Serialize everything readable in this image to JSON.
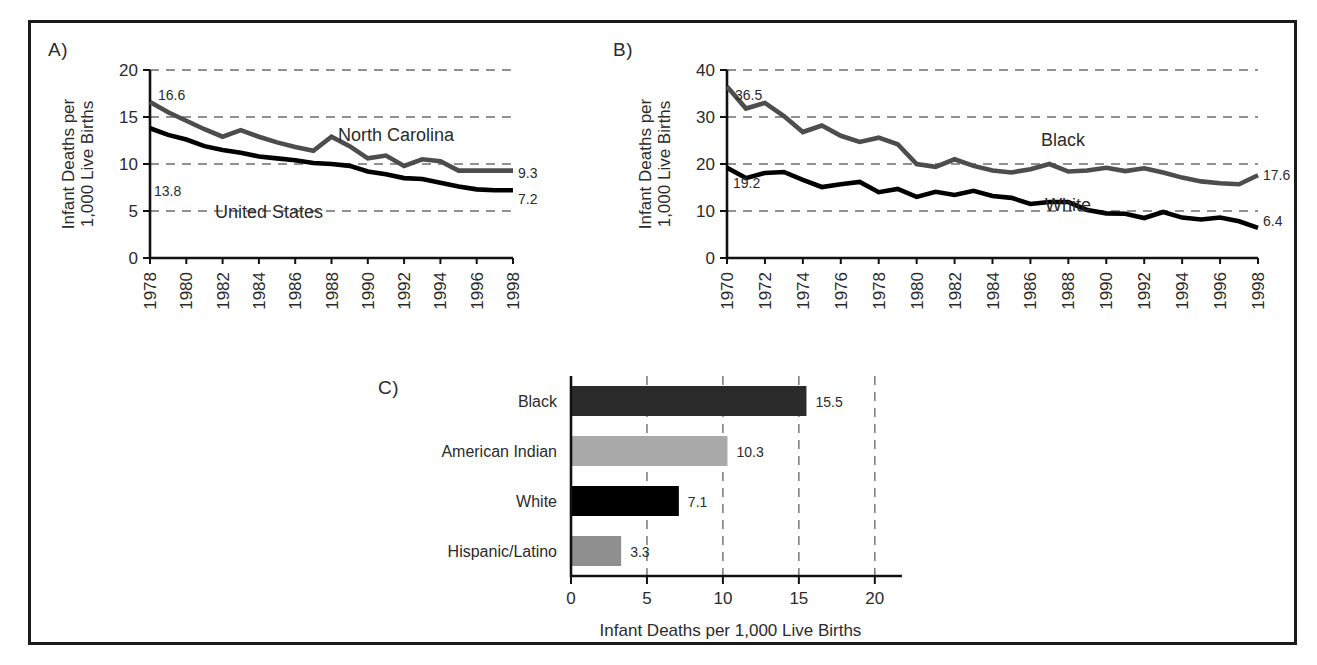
{
  "figure": {
    "panels": [
      "A)",
      "B)",
      "C)"
    ]
  },
  "chart_data": [
    {
      "panel": "A)",
      "type": "line",
      "title": "",
      "xlabel": "",
      "ylabel": "Infant Deaths per 1,000 Live Births",
      "ylim": [
        0,
        20
      ],
      "xlim": [
        1978,
        1998
      ],
      "yticks": [
        "0",
        "5",
        "10",
        "15",
        "20"
      ],
      "ytick_values": [
        0,
        5,
        10,
        15,
        20
      ],
      "xticks": [
        "1978",
        "1980",
        "1982",
        "1984",
        "1986",
        "1988",
        "1990",
        "1992",
        "1994",
        "1996",
        "1998"
      ],
      "xtick_values": [
        1978,
        1980,
        1982,
        1984,
        1986,
        1988,
        1990,
        1992,
        1994,
        1996,
        1998
      ],
      "grid": true,
      "x": [
        1978,
        1979,
        1980,
        1981,
        1982,
        1983,
        1984,
        1985,
        1986,
        1987,
        1988,
        1989,
        1990,
        1991,
        1992,
        1993,
        1994,
        1995,
        1996,
        1997,
        1998
      ],
      "series": [
        {
          "name": "North Carolina",
          "color": "#4d4d4d",
          "values": [
            16.6,
            15.5,
            14.6,
            13.7,
            12.9,
            13.6,
            12.9,
            12.3,
            11.8,
            11.4,
            12.9,
            11.9,
            10.6,
            10.9,
            9.8,
            10.5,
            10.3,
            9.3,
            9.3,
            9.3,
            9.3
          ],
          "start_label": "16.6",
          "end_label": "9.3"
        },
        {
          "name": "United States",
          "color": "#000000",
          "values": [
            13.8,
            13.1,
            12.6,
            11.9,
            11.5,
            11.2,
            10.8,
            10.6,
            10.4,
            10.1,
            10.0,
            9.8,
            9.2,
            8.9,
            8.5,
            8.4,
            8.0,
            7.6,
            7.3,
            7.2,
            7.2
          ],
          "start_label": "13.8",
          "end_label": "7.2"
        }
      ]
    },
    {
      "panel": "B)",
      "type": "line",
      "title": "",
      "xlabel": "",
      "ylabel": "Infant Deaths per 1,000 Live Births",
      "ylim": [
        0,
        40
      ],
      "xlim": [
        1970,
        1998
      ],
      "yticks": [
        "0",
        "10",
        "20",
        "30",
        "40"
      ],
      "ytick_values": [
        0,
        10,
        20,
        30,
        40
      ],
      "xticks": [
        "1970",
        "1972",
        "1974",
        "1976",
        "1978",
        "1980",
        "1982",
        "1984",
        "1986",
        "1988",
        "1990",
        "1992",
        "1994",
        "1996",
        "1998"
      ],
      "xtick_values": [
        1970,
        1972,
        1974,
        1976,
        1978,
        1980,
        1982,
        1984,
        1986,
        1988,
        1990,
        1992,
        1994,
        1996,
        1998
      ],
      "grid": true,
      "x": [
        1970,
        1971,
        1972,
        1973,
        1974,
        1975,
        1976,
        1977,
        1978,
        1979,
        1980,
        1981,
        1982,
        1983,
        1984,
        1985,
        1986,
        1987,
        1988,
        1989,
        1990,
        1991,
        1992,
        1993,
        1994,
        1995,
        1996,
        1997,
        1998
      ],
      "series": [
        {
          "name": "Black",
          "color": "#4d4d4d",
          "values": [
            36.5,
            31.8,
            33.0,
            30.2,
            26.8,
            28.2,
            26.0,
            24.7,
            25.6,
            24.2,
            20.0,
            19.4,
            21.0,
            19.6,
            18.6,
            18.2,
            18.9,
            20.0,
            18.4,
            18.6,
            19.2,
            18.5,
            19.1,
            18.2,
            17.1,
            16.3,
            15.9,
            15.7,
            17.6
          ],
          "start_label": "36.5",
          "end_label": "17.6"
        },
        {
          "name": "White",
          "color": "#000000",
          "values": [
            19.2,
            17.0,
            18.1,
            18.3,
            16.6,
            15.1,
            15.7,
            16.2,
            14.0,
            14.7,
            13.0,
            14.1,
            13.4,
            14.3,
            13.2,
            12.8,
            11.5,
            11.9,
            11.9,
            10.2,
            9.5,
            9.4,
            8.5,
            9.8,
            8.6,
            8.2,
            8.6,
            7.8,
            6.4
          ],
          "start_label": "19.2",
          "end_label": "6.4"
        }
      ]
    },
    {
      "panel": "C)",
      "type": "bar",
      "orientation": "horizontal",
      "title": "",
      "xlabel": "Infant Deaths per 1,000 Live Births",
      "ylabel": "",
      "xlim": [
        0,
        21
      ],
      "xticks": [
        "0",
        "5",
        "10",
        "15",
        "20"
      ],
      "xtick_values": [
        0,
        5,
        10,
        15,
        20
      ],
      "grid": true,
      "categories": [
        "Black",
        "American Indian",
        "White",
        "Hispanic/Latino"
      ],
      "values": [
        15.5,
        10.3,
        7.1,
        3.3
      ],
      "value_labels": [
        "15.5",
        "10.3",
        "7.1",
        "3.3"
      ],
      "colors": [
        "#2b2b2b",
        "#a9a9a9",
        "#000000",
        "#8f8f8f"
      ]
    }
  ]
}
